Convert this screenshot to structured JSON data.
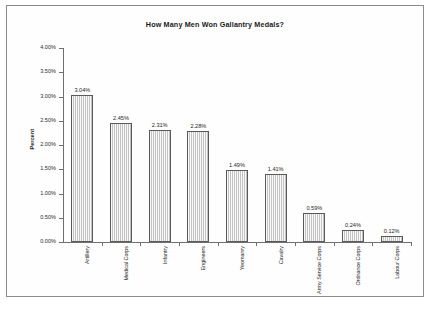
{
  "figure": {
    "frame_color": "#8d8d8d",
    "background": "#ffffff"
  },
  "chart_data": {
    "type": "bar",
    "title": "How Many Men Won Gallantry Medals?",
    "xlabel": "",
    "ylabel": "Percent",
    "ylim": [
      0,
      4.0
    ],
    "ytick_labels": [
      "0.00%",
      "0.50%",
      "1.00%",
      "1.50%",
      "2.00%",
      "2.50%",
      "3.00%",
      "3.50%",
      "4.00%"
    ],
    "ytick_values": [
      0,
      0.5,
      1.0,
      1.5,
      2.0,
      2.5,
      3.0,
      3.5,
      4.0
    ],
    "grid": false,
    "legend": false,
    "categories": [
      "Artillery",
      "Medical Corps",
      "Infantry",
      "Engineers",
      "Yeomanry",
      "Cavalry",
      "Army Service Corps",
      "Ordnance Corps",
      "Labour Corps"
    ],
    "values": [
      3.04,
      2.45,
      2.31,
      2.28,
      1.49,
      1.41,
      0.59,
      0.24,
      0.12
    ],
    "value_labels": [
      "3.04%",
      "2.45%",
      "2.31%",
      "2.28%",
      "1.49%",
      "1.41%",
      "0.59%",
      "0.24%",
      "0.12%"
    ],
    "bar_fill": "#d6d6d6",
    "bar_border": "#5a5a5a"
  }
}
